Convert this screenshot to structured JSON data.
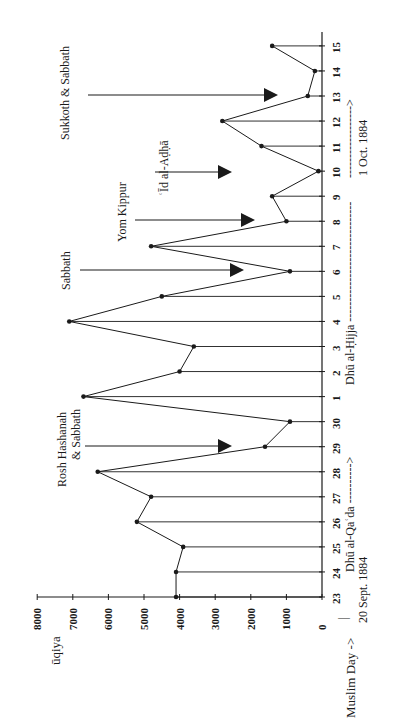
{
  "chart_data": {
    "type": "line",
    "orientation": "rotated-90-ccw",
    "title": "",
    "xlabel": "Muslim Day -->",
    "ylabel": "ūqiya",
    "ylim": [
      0,
      8000
    ],
    "y_ticks": [
      0,
      1000,
      2000,
      3000,
      4000,
      5000,
      6000,
      7000,
      8000
    ],
    "categories": [
      "23",
      "24",
      "25",
      "26",
      "27",
      "28",
      "29",
      "30",
      "1",
      "2",
      "3",
      "4",
      "5",
      "6",
      "7",
      "8",
      "9",
      "10",
      "11",
      "12",
      "13",
      "14",
      "15"
    ],
    "series": [
      {
        "name": "ūqiya",
        "values": [
          4100,
          4100,
          3900,
          5200,
          4800,
          6300,
          1600,
          900,
          6700,
          4000,
          3600,
          7100,
          4500,
          900,
          4800,
          1000,
          1400,
          100,
          1700,
          2800,
          400,
          200,
          1400
        ]
      }
    ],
    "months": [
      {
        "label": "Dhū al-Qaʿda ---------->",
        "start_day": "23",
        "start_date": "20 Sept. 1884"
      },
      {
        "label": "Dhū al-Ḥijja ------------------------------",
        "start_day": "1"
      },
      {
        "label": "------------------>",
        "start_day": "10",
        "start_date": "1 Oct. 1884"
      }
    ],
    "annotations": [
      {
        "text": "Rosh Hashanah",
        "text2": "& Sabbath",
        "day": "29"
      },
      {
        "text": "Sabbath",
        "day": "6"
      },
      {
        "text": "Yom Kippur",
        "day": "8"
      },
      {
        "text": "ʿĪd al-Aḍḥā",
        "day": "10"
      },
      {
        "text": "Sukkoth & Sabbath",
        "day": "13"
      }
    ],
    "grid": false,
    "legend": null
  },
  "labels": {
    "ylabel": "ūqiya",
    "xlabel": "Muslim Day ->",
    "start_date": "20 Sept. 1884",
    "oct_date": "1 Oct. 1884",
    "month1": "Dhū al-Qaʿda ---------->",
    "month2": "Dhū al-Ḥijja ------------------------------",
    "month3": "------------------>",
    "ann_rosh1": "Rosh Hashanah",
    "ann_rosh2": "& Sabbath",
    "ann_sabbath": "Sabbath",
    "ann_yom": "Yom Kippur",
    "ann_id": "ʿĪd al-Aḍḥā",
    "ann_sukkoth": "Sukkoth & Sabbath"
  },
  "colors": {
    "ink": "#1a1a1a",
    "background": "#ffffff"
  }
}
